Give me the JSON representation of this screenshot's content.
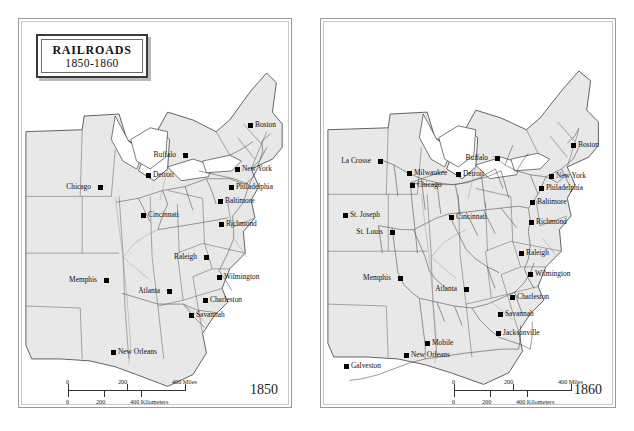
{
  "figure": {
    "title_line1": "RAILROADS",
    "title_line2": "1850-1860",
    "colors": {
      "land": "#e8e8e8",
      "water": "#ffffff",
      "state_border": "#6f6f6f",
      "coast": "#3a3a3a",
      "rail": "#4a4a4a",
      "marker": "#000000",
      "panel_border": "#9a9a9a"
    }
  },
  "panels": [
    {
      "id": "panel-1850",
      "year_label": "1850",
      "scale": {
        "miles_ticks": [
          "0",
          "200",
          "400 Miles"
        ],
        "km_ticks": [
          "0",
          "200",
          "400 Kilometers"
        ]
      },
      "cities": [
        {
          "name": "Boston",
          "x": 247,
          "y": 122,
          "pos": "lbl-right"
        },
        {
          "name": "Buffalo",
          "x": 182,
          "y": 152,
          "pos": "lbl-left"
        },
        {
          "name": "New York",
          "x": 234,
          "y": 166,
          "pos": "lbl-right"
        },
        {
          "name": "Detroit",
          "x": 145,
          "y": 172,
          "pos": "lbl-right"
        },
        {
          "name": "Philadelphia",
          "x": 228,
          "y": 184,
          "pos": "lbl-right"
        },
        {
          "name": "Chicago",
          "x": 97,
          "y": 184,
          "pos": "lbl-left"
        },
        {
          "name": "Baltimore",
          "x": 217,
          "y": 198,
          "pos": "lbl-right"
        },
        {
          "name": "Cincinnati",
          "x": 140,
          "y": 212,
          "pos": "lbl-right"
        },
        {
          "name": "Richmond",
          "x": 218,
          "y": 221,
          "pos": "lbl-right"
        },
        {
          "name": "Raleigh",
          "x": 203,
          "y": 254,
          "pos": "lbl-left"
        },
        {
          "name": "Wilmington",
          "x": 216,
          "y": 274,
          "pos": "lbl-right"
        },
        {
          "name": "Memphis",
          "x": 103,
          "y": 277,
          "pos": "lbl-left"
        },
        {
          "name": "Atlanta",
          "x": 166,
          "y": 288,
          "pos": "lbl-left"
        },
        {
          "name": "Charleston",
          "x": 202,
          "y": 297,
          "pos": "lbl-right"
        },
        {
          "name": "Savannah",
          "x": 188,
          "y": 312,
          "pos": "lbl-right"
        },
        {
          "name": "New Orleans",
          "x": 110,
          "y": 349,
          "pos": "lbl-right"
        }
      ]
    },
    {
      "id": "panel-1860",
      "year_label": "1860",
      "scale": {
        "miles_ticks": [
          "0",
          "200",
          "400 Miles"
        ],
        "km_ticks": [
          "0",
          "200",
          "400 Kilometers"
        ]
      },
      "cities": [
        {
          "name": "Boston",
          "x": 570,
          "y": 142,
          "pos": "lbl-right"
        },
        {
          "name": "Buffalo",
          "x": 494,
          "y": 155,
          "pos": "lbl-left"
        },
        {
          "name": "New York",
          "x": 548,
          "y": 173,
          "pos": "lbl-right"
        },
        {
          "name": "La Crosse",
          "x": 377,
          "y": 158,
          "pos": "lbl-left"
        },
        {
          "name": "Milwaukee",
          "x": 406,
          "y": 170,
          "pos": "lbl-right"
        },
        {
          "name": "Detroit",
          "x": 455,
          "y": 171,
          "pos": "lbl-right"
        },
        {
          "name": "Philadelphia",
          "x": 538,
          "y": 185,
          "pos": "lbl-right"
        },
        {
          "name": "Chicago",
          "x": 409,
          "y": 182,
          "pos": "lbl-right"
        },
        {
          "name": "Baltimore",
          "x": 529,
          "y": 199,
          "pos": "lbl-right"
        },
        {
          "name": "Richmond",
          "x": 528,
          "y": 219,
          "pos": "lbl-right"
        },
        {
          "name": "St. Joseph",
          "x": 342,
          "y": 212,
          "pos": "lbl-right"
        },
        {
          "name": "Cincinnati",
          "x": 448,
          "y": 214,
          "pos": "lbl-right"
        },
        {
          "name": "St. Louis",
          "x": 389,
          "y": 229,
          "pos": "lbl-left"
        },
        {
          "name": "Raleigh",
          "x": 518,
          "y": 250,
          "pos": "lbl-right"
        },
        {
          "name": "Wilmington",
          "x": 527,
          "y": 271,
          "pos": "lbl-right"
        },
        {
          "name": "Memphis",
          "x": 397,
          "y": 275,
          "pos": "lbl-left"
        },
        {
          "name": "Atlanta",
          "x": 463,
          "y": 286,
          "pos": "lbl-left"
        },
        {
          "name": "Charleston",
          "x": 509,
          "y": 294,
          "pos": "lbl-right"
        },
        {
          "name": "Savannah",
          "x": 497,
          "y": 311,
          "pos": "lbl-right"
        },
        {
          "name": "Jacksonville",
          "x": 495,
          "y": 330,
          "pos": "lbl-right"
        },
        {
          "name": "Mobile",
          "x": 424,
          "y": 340,
          "pos": "lbl-right"
        },
        {
          "name": "New Orleans",
          "x": 403,
          "y": 352,
          "pos": "lbl-right"
        },
        {
          "name": "Galveston",
          "x": 343,
          "y": 363,
          "pos": "lbl-right"
        }
      ]
    }
  ]
}
